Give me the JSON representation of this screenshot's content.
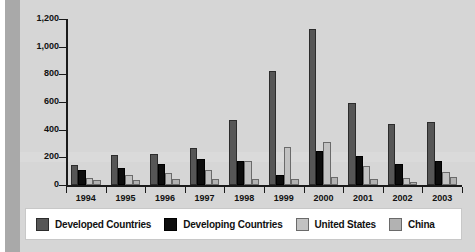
{
  "chart_data": {
    "type": "bar",
    "title": "",
    "subtitle": "",
    "xlabel": "",
    "ylabel": "",
    "grid": false,
    "legend_position": "bottom",
    "ylim": [
      0,
      1200
    ],
    "yticks": [
      0,
      200,
      400,
      600,
      800,
      1000,
      1200
    ],
    "ytick_labels": [
      "0",
      "200",
      "400",
      "600",
      "800",
      "1,000",
      "1,200"
    ],
    "categories": [
      "1994",
      "1995",
      "1996",
      "1997",
      "1998",
      "1999",
      "2000",
      "2001",
      "2002",
      "2003"
    ],
    "series": [
      {
        "name": "Developed Countries",
        "color": "#565656",
        "values": [
          145,
          215,
          225,
          270,
          470,
          825,
          1125,
          590,
          440,
          455
        ]
      },
      {
        "name": "Developing Countries",
        "color": "#0d0d0d",
        "values": [
          105,
          120,
          150,
          185,
          175,
          75,
          245,
          210,
          150,
          175
        ]
      },
      {
        "name": "United States",
        "color": "#c2c2c2",
        "values": [
          50,
          70,
          85,
          110,
          175,
          275,
          310,
          135,
          50,
          95
        ]
      },
      {
        "name": "China",
        "color": "#b2b2b2",
        "values": [
          35,
          35,
          40,
          45,
          45,
          40,
          55,
          45,
          25,
          60
        ]
      }
    ]
  },
  "colors": {
    "background": "#d4d4d4",
    "plot_background": "#d6d6d6",
    "axis": "#1a1a1a",
    "legend_background": "#ffffff",
    "left_band": "#a9a9a9"
  }
}
